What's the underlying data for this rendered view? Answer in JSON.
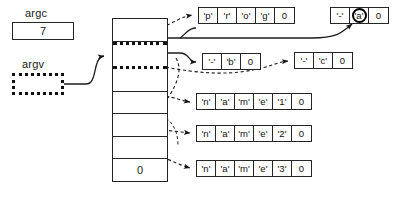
{
  "diagram": {
    "variables": [
      {
        "name": "argc",
        "label": "argc",
        "value": "7",
        "style": "solid"
      },
      {
        "name": "argv",
        "label": "argv",
        "value": "",
        "style": "dotted"
      }
    ],
    "pointer_array": {
      "name": "argv-pointer-array",
      "cells": [
        {
          "index": 0,
          "value": "",
          "highlight": false
        },
        {
          "index": 1,
          "value": "",
          "highlight": true
        },
        {
          "index": 2,
          "value": "",
          "highlight": false
        },
        {
          "index": 3,
          "value": "",
          "highlight": false
        },
        {
          "index": 4,
          "value": "",
          "highlight": false
        },
        {
          "index": 5,
          "value": "",
          "highlight": false
        },
        {
          "index": 6,
          "value": "0",
          "highlight": false
        }
      ]
    },
    "strings": [
      {
        "name": "string-prog",
        "text": "prog",
        "chars": [
          {
            "glyph": "'p'",
            "circled": false
          },
          {
            "glyph": "'r'",
            "circled": false
          },
          {
            "glyph": "'o'",
            "circled": false
          },
          {
            "glyph": "'g'",
            "circled": false
          },
          {
            "glyph": "0",
            "circled": false
          }
        ]
      },
      {
        "name": "string-dash-a",
        "text": "-a",
        "chars": [
          {
            "glyph": "'-'",
            "circled": false
          },
          {
            "glyph": "'a'",
            "circled": true
          },
          {
            "glyph": "0",
            "circled": false
          }
        ]
      },
      {
        "name": "string-dash-b",
        "text": "-b",
        "chars": [
          {
            "glyph": "'-'",
            "circled": false
          },
          {
            "glyph": "'b'",
            "circled": false
          },
          {
            "glyph": "0",
            "circled": false
          }
        ]
      },
      {
        "name": "string-dash-c",
        "text": "-c",
        "chars": [
          {
            "glyph": "'-'",
            "circled": false
          },
          {
            "glyph": "'c'",
            "circled": false
          },
          {
            "glyph": "0",
            "circled": false
          }
        ]
      },
      {
        "name": "string-name1",
        "text": "name1",
        "chars": [
          {
            "glyph": "'n'",
            "circled": false
          },
          {
            "glyph": "'a'",
            "circled": false
          },
          {
            "glyph": "'m'",
            "circled": false
          },
          {
            "glyph": "'e'",
            "circled": false
          },
          {
            "glyph": "'1'",
            "circled": false
          },
          {
            "glyph": "0",
            "circled": false
          }
        ]
      },
      {
        "name": "string-name2",
        "text": "name2",
        "chars": [
          {
            "glyph": "'n'",
            "circled": false
          },
          {
            "glyph": "'a'",
            "circled": false
          },
          {
            "glyph": "'m'",
            "circled": false
          },
          {
            "glyph": "'e'",
            "circled": false
          },
          {
            "glyph": "'2'",
            "circled": false
          },
          {
            "glyph": "0",
            "circled": false
          }
        ]
      },
      {
        "name": "string-name3",
        "text": "name3",
        "chars": [
          {
            "glyph": "'n'",
            "circled": false
          },
          {
            "glyph": "'a'",
            "circled": false
          },
          {
            "glyph": "'m'",
            "circled": false
          },
          {
            "glyph": "'e'",
            "circled": false
          },
          {
            "glyph": "'3'",
            "circled": false
          },
          {
            "glyph": "0",
            "circled": false
          }
        ]
      }
    ],
    "colors": {
      "stroke": "#262626",
      "text": "#1a1a1a",
      "background": "#ffffff",
      "emphasis": "#000000"
    }
  }
}
